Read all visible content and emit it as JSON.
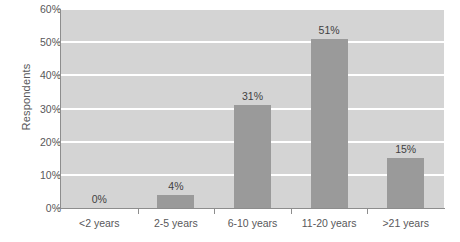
{
  "chart_data": {
    "type": "bar",
    "title": "",
    "subtitle": "",
    "xlabel": "",
    "ylabel": "Respondents",
    "categories": [
      "<2 years",
      "2-5 years",
      "6-10 years",
      "11-20 years",
      ">21 years"
    ],
    "values": [
      0,
      4,
      31,
      51,
      15
    ],
    "data_labels": [
      "0%",
      "4%",
      "31%",
      "51%",
      "15%"
    ],
    "ylim": [
      0,
      60
    ],
    "yticks": [
      0,
      10,
      20,
      30,
      40,
      50,
      60
    ],
    "ytick_labels": [
      "0%",
      "10%",
      "20%",
      "30%",
      "40%",
      "50%",
      "60%"
    ],
    "grid": true,
    "legend": "none",
    "colors": {
      "bar": "#9a9a9a",
      "plot_background": "#d4d4d4",
      "gridline": "#ffffff",
      "axis": "#8d8d8d",
      "text": "#58585a",
      "data_label_text": "#3f3f41",
      "page_background": "#ffffff"
    }
  }
}
